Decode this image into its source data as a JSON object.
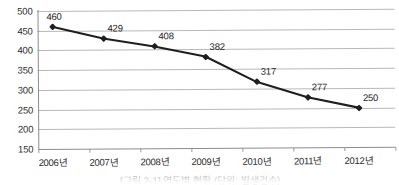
{
  "chart_data": {
    "type": "line",
    "title": "",
    "xlabel": "",
    "ylabel": "",
    "categories": [
      "2006년",
      "2007년",
      "2008년",
      "2009년",
      "2010년",
      "2011년",
      "2012년"
    ],
    "values": [
      460,
      429,
      408,
      382,
      317,
      277,
      250
    ],
    "point_labels": [
      "460",
      "429",
      "408",
      "382",
      "317",
      "277",
      "250"
    ],
    "ylim": [
      150,
      500
    ],
    "ytick_step": 50,
    "yticks": [
      "500",
      "450",
      "400",
      "350",
      "300",
      "250",
      "200",
      "150"
    ],
    "grid": true,
    "legend": "none",
    "series_color": "#1f1f1f",
    "grid_color": "#b9b9b9",
    "axis_color": "#8d8d8d",
    "marker": "diamond"
  },
  "caption": "[그림 2-1] 연도별 현황 (단위: 발생건수)"
}
